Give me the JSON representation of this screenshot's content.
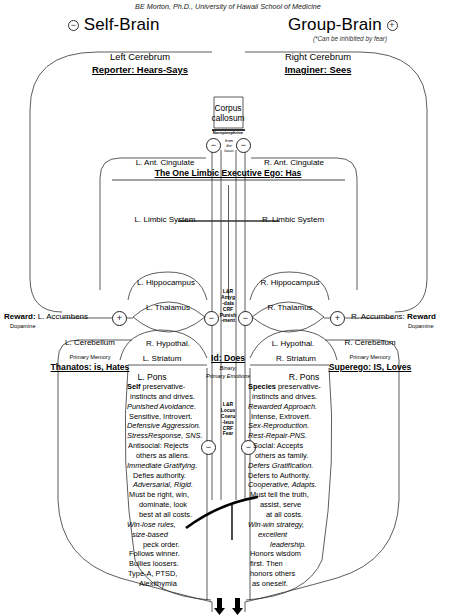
{
  "credit": "BE Morton, Ph.D., University of Hawaii School of Medicine",
  "header": {
    "left_sign": "−",
    "left_title": "Self-Brain",
    "right_title": "Group-Brain",
    "right_sign": "+",
    "right_note": "(*Can be inhibited by fear)"
  },
  "left_hemisphere": {
    "cerebrum": "Left Cerebrum",
    "role": "Reporter: Hears-Says",
    "ant_cingulate": "L. Ant. Cingulate",
    "limbic": "L. Limbic System",
    "hippocampus": "L. Hippocampus",
    "thalamus": "L. Thalamus",
    "hypothal": "R. Hypothal.",
    "striatum": "L. Striatum",
    "pons": "L. Pons",
    "accumbens": "L. Accumbens",
    "reward": "Reward:",
    "dopamine": "Dopamine",
    "cerebellum": "L. Cerebellum",
    "memory": "Primary Memory",
    "persona": "Thanatos: is, Hates",
    "traits": [
      {
        "text": "Self preservative-",
        "style": "bold-lead"
      },
      {
        "text": "instincts and drives.",
        "style": "plain"
      },
      {
        "text": "Punished Avoidance.",
        "style": "italic"
      },
      {
        "text": "Sensitive, Introvert.",
        "style": "plain"
      },
      {
        "text": "Defensive Aggression.",
        "style": "italic"
      },
      {
        "text": "StressResponse, SNS.",
        "style": "italic"
      },
      {
        "text": "Antisocial: Rejects",
        "style": "plain"
      },
      {
        "text": "others as aliens.",
        "style": "plain"
      },
      {
        "text": "Immediate Gratifying.",
        "style": "italic"
      },
      {
        "text": "Defies authority.",
        "style": "plain"
      },
      {
        "text": "Adversarial, Rigid.",
        "style": "italic"
      },
      {
        "text": "Must be right, win,",
        "style": "plain"
      },
      {
        "text": "dominate, look",
        "style": "plain"
      },
      {
        "text": "best at all costs.",
        "style": "plain"
      },
      {
        "text": "Win-lose rules,",
        "style": "italic"
      },
      {
        "text": "size-based",
        "style": "italic"
      },
      {
        "text": "peck order.",
        "style": "plain"
      },
      {
        "text": "Follows winner.",
        "style": "plain"
      },
      {
        "text": "Bullies loosers.",
        "style": "plain"
      },
      {
        "text": "Type-A, PTSD,",
        "style": "plain"
      },
      {
        "text": "Alexithymia",
        "style": "plain"
      }
    ]
  },
  "right_hemisphere": {
    "cerebrum": "Right Cerebrum",
    "role": "Imaginer: Sees",
    "ant_cingulate": "R. Ant. Cingulate",
    "limbic": "R. Limbic System",
    "hippocampus": "R. Hippocampus",
    "thalamus": "R. Thalamus",
    "hypothal": "L. Hypothal.",
    "striatum": "R. Striatum",
    "pons": "R. Pons",
    "accumbens": "R. Accumbens:",
    "reward": "Reward",
    "dopamine": "Dopamine",
    "cerebellum": "R. Cerebellum",
    "memory": "Primary Memory",
    "persona": "Superego: IS, Loves",
    "traits": [
      {
        "text": "Species preservative-",
        "style": "bold-lead"
      },
      {
        "text": "instincts and drives.",
        "style": "plain"
      },
      {
        "text": "Rewarded Approach.",
        "style": "italic"
      },
      {
        "text": "Intense, Extrovert.",
        "style": "plain"
      },
      {
        "text": "Sex-Reproduction.",
        "style": "italic"
      },
      {
        "text": "Rest-Repair-PNS.",
        "style": "italic"
      },
      {
        "text": "Social: Accepts",
        "style": "plain"
      },
      {
        "text": "others as family.",
        "style": "plain"
      },
      {
        "text": "Defers Gratification.",
        "style": "italic"
      },
      {
        "text": "Defers to Authority.",
        "style": "plain"
      },
      {
        "text": "Cooperative, Adapts.",
        "style": "italic"
      },
      {
        "text": "Must tell the truth,",
        "style": "plain"
      },
      {
        "text": "assist, serve",
        "style": "plain"
      },
      {
        "text": "at all costs.",
        "style": "plain"
      },
      {
        "text": "Win-win strategy,",
        "style": "italic"
      },
      {
        "text": "excellent",
        "style": "italic"
      },
      {
        "text": "leadership.",
        "style": "italic"
      },
      {
        "text": "Honors wisdom",
        "style": "plain"
      },
      {
        "text": "first.      Then",
        "style": "plain"
      },
      {
        "text": "honors others",
        "style": "plain"
      },
      {
        "text": "as oneself.",
        "style": "plain"
      }
    ]
  },
  "center": {
    "corpus_callosum_line1": "Corpus",
    "corpus_callosum_line2": "callosum",
    "norepinephrine": "Norepinephrine",
    "from_locus_line1": "from",
    "from_locus_line2": "the",
    "from_locus_line3": "locus",
    "ego": "The One Limbic Executive Ego: Has",
    "amygdala": [
      "L&R",
      "Amyg",
      "-dala",
      "CRF",
      "Punish",
      "-ment"
    ],
    "id": "Id: Does",
    "id_sub1": "Binary,",
    "id_sub2": "Primary Emotions",
    "locus": [
      "L&R",
      "Locus",
      "Coeru",
      "-leus",
      "CRF",
      "Fear"
    ]
  },
  "operators": {
    "minus": "−",
    "plus": "+"
  }
}
